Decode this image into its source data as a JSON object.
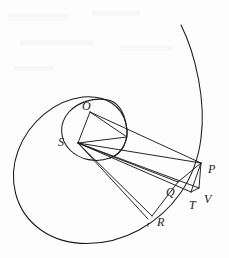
{
  "figure": {
    "background_color": "#fdfdfd",
    "ink_color": "#1a1a1a",
    "width": 229,
    "height": 258
  },
  "labels": [
    {
      "id": "O",
      "text": "O",
      "x": 82,
      "y": 100,
      "size": "lg"
    },
    {
      "id": "S",
      "text": "S",
      "x": 58,
      "y": 136,
      "size": "lg"
    },
    {
      "id": "P",
      "text": "P",
      "x": 208,
      "y": 163,
      "size": "lg"
    },
    {
      "id": "V",
      "text": "V",
      "x": 204,
      "y": 193,
      "size": "lg"
    },
    {
      "id": "T",
      "text": "T",
      "x": 189,
      "y": 199,
      "size": "lg"
    },
    {
      "id": "Q",
      "text": "Q",
      "x": 166,
      "y": 186,
      "size": "lg"
    },
    {
      "id": "R",
      "text": "R",
      "x": 157,
      "y": 216,
      "size": "lg"
    },
    {
      "id": "r",
      "text": "r",
      "x": 147,
      "y": 221,
      "size": "sm"
    }
  ],
  "points": {
    "S": {
      "x": 78,
      "y": 143
    },
    "O": {
      "x": 90,
      "y": 112
    },
    "P": {
      "x": 201,
      "y": 163
    },
    "V": {
      "x": 199,
      "y": 188
    },
    "T": {
      "x": 191,
      "y": 192
    },
    "Q": {
      "x": 178,
      "y": 182
    },
    "R": {
      "x": 152,
      "y": 216
    },
    "r": {
      "x": 148,
      "y": 219
    },
    "A": {
      "x": 127,
      "y": 137
    }
  },
  "curves": {
    "outer_spiral": "M 181 25 C 196 55 206 102 201 138 C 196 180 172 212 139 230 C 106 248 66 248 41 230 C 14 211 8 178 18 151 C 29 121 56 100 83 97 C 106 95 122 106 126 124 C 130 140 122 154 110 158",
    "inner_circle": "M 126 124 C 130 140 122 154 110 158 C 96 163 80 160 70 150 C 59 139 59 123 69 112 C 78 102 94 97 108 100 C 118 102 124 112 126 124"
  },
  "segments": [
    {
      "name": "S-O",
      "from": "S",
      "to": "O"
    },
    {
      "name": "O-P",
      "from": "O",
      "to": "P"
    },
    {
      "name": "S-P",
      "from": "S",
      "to": "P"
    },
    {
      "name": "S-V",
      "from": "S",
      "to": "V"
    },
    {
      "name": "S-T",
      "from": "S",
      "to": "T"
    },
    {
      "name": "S-Q",
      "from": "S",
      "to": "Q"
    },
    {
      "name": "S-R",
      "from": "S",
      "to": "R"
    },
    {
      "name": "S-r",
      "from": "S",
      "to": "r"
    },
    {
      "name": "S-A",
      "from": "S",
      "to": "A"
    },
    {
      "name": "A-O",
      "from": "A",
      "to": "O"
    },
    {
      "name": "P-T",
      "from": "P",
      "to": "T"
    },
    {
      "name": "P-V",
      "from": "P",
      "to": "V"
    },
    {
      "name": "T-V",
      "from": "T",
      "to": "V"
    },
    {
      "name": "P-Q",
      "from": "P",
      "to": "Q"
    },
    {
      "name": "Q-R",
      "from": "Q",
      "to": "R"
    }
  ]
}
